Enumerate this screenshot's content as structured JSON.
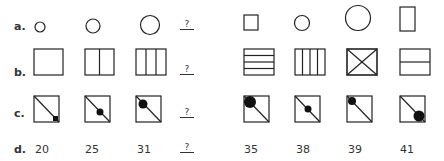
{
  "rows": [
    {
      "label": "a.",
      "missing": "?"
    },
    {
      "label": "b.",
      "missing": "?"
    },
    {
      "label": "c.",
      "missing": "?"
    },
    {
      "label": "d.",
      "missing": "?",
      "sequence": [
        "20",
        "25",
        "31"
      ],
      "options": [
        "35",
        "38",
        "39",
        "41"
      ]
    }
  ],
  "colors": {
    "stroke": "#222222",
    "fill": "#111111"
  }
}
